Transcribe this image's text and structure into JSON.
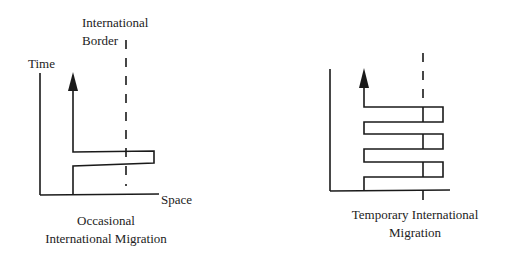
{
  "figure": {
    "left_panel": {
      "border_label_line1": "International",
      "border_label_line2": "Border",
      "y_axis_label": "Time",
      "x_axis_label": "Space",
      "caption_line1": "Occasional",
      "caption_line2": "International Migration"
    },
    "right_panel": {
      "caption_line1": "Temporary International",
      "caption_line2": "Migration"
    },
    "colors": {
      "ink": "#1a1a1a",
      "background": "#ffffff"
    }
  }
}
